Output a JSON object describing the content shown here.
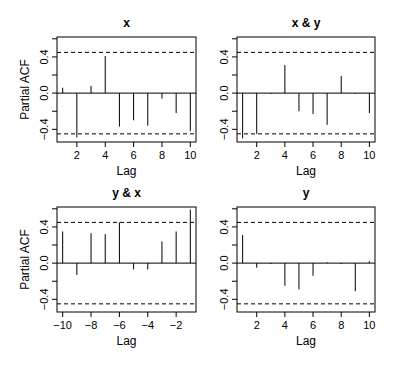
{
  "figure": {
    "layout": "2x2 grid of partial autocorrelation plots",
    "ylabel_shared": "Partial ACF"
  },
  "chart_data": [
    {
      "type": "bar",
      "subtype": "partial-acf-spikes",
      "title": "x",
      "xlabel": "Lag",
      "ylabel": "Partial ACF",
      "x": [
        1,
        2,
        3,
        4,
        5,
        6,
        7,
        8,
        9,
        10
      ],
      "values": [
        0.06,
        -0.49,
        0.08,
        0.41,
        -0.37,
        -0.3,
        -0.36,
        -0.06,
        -0.22,
        -0.42
      ],
      "xticks": [
        2,
        4,
        6,
        8,
        10
      ],
      "xtick_labels": [
        "2",
        "4",
        "6",
        "8",
        "10"
      ],
      "xlim": [
        0.6,
        10.4
      ],
      "yticks": [
        -0.4,
        -0.2,
        0.0,
        0.2,
        0.4,
        0.6
      ],
      "ytick_labels": [
        "-0.4",
        "",
        "0.0",
        "",
        "0.4",
        ""
      ],
      "ylim": [
        -0.54,
        0.62
      ],
      "confidence_bounds": [
        -0.45,
        0.45
      ],
      "grid": false,
      "show_ylabel": true
    },
    {
      "type": "bar",
      "subtype": "partial-acf-spikes",
      "title": "x & y",
      "xlabel": "Lag",
      "ylabel": "",
      "x": [
        1,
        2,
        3,
        4,
        5,
        6,
        7,
        8,
        9,
        10
      ],
      "values": [
        -0.5,
        -0.45,
        -0.01,
        0.31,
        -0.2,
        -0.23,
        -0.35,
        0.19,
        -0.01,
        -0.22
      ],
      "xticks": [
        2,
        4,
        6,
        8,
        10
      ],
      "xtick_labels": [
        "2",
        "4",
        "6",
        "8",
        "10"
      ],
      "xlim": [
        0.6,
        10.4
      ],
      "yticks": [
        -0.4,
        -0.2,
        0.0,
        0.2,
        0.4,
        0.6
      ],
      "ytick_labels": [
        "-0.4",
        "",
        "0.0",
        "",
        "0.4",
        ""
      ],
      "ylim": [
        -0.54,
        0.62
      ],
      "confidence_bounds": [
        -0.45,
        0.45
      ],
      "grid": false,
      "show_ylabel": false
    },
    {
      "type": "bar",
      "subtype": "partial-acf-spikes",
      "title": "y & x",
      "xlabel": "Lag",
      "ylabel": "Partial ACF",
      "x": [
        -10,
        -9,
        -8,
        -7,
        -6,
        -5,
        -4,
        -3,
        -2,
        -1
      ],
      "values": [
        0.35,
        -0.13,
        0.33,
        0.32,
        0.45,
        -0.07,
        -0.07,
        0.24,
        0.35,
        0.59
      ],
      "xticks": [
        -10,
        -8,
        -6,
        -4,
        -2
      ],
      "xtick_labels": [
        "−10",
        "−8",
        "−6",
        "−4",
        "−2"
      ],
      "xlim": [
        -10.4,
        -0.6
      ],
      "yticks": [
        -0.4,
        -0.2,
        0.0,
        0.2,
        0.4,
        0.6
      ],
      "ytick_labels": [
        "-0.4",
        "",
        "0.0",
        "",
        "0.4",
        ""
      ],
      "ylim": [
        -0.54,
        0.62
      ],
      "confidence_bounds": [
        -0.45,
        0.45
      ],
      "grid": false,
      "show_ylabel": true
    },
    {
      "type": "bar",
      "subtype": "partial-acf-spikes",
      "title": "y",
      "xlabel": "Lag",
      "ylabel": "",
      "x": [
        1,
        2,
        3,
        4,
        5,
        6,
        7,
        8,
        9,
        10
      ],
      "values": [
        0.31,
        -0.05,
        -0.01,
        -0.25,
        -0.29,
        -0.14,
        0.01,
        -0.01,
        -0.31,
        0.02
      ],
      "xticks": [
        2,
        4,
        6,
        8,
        10
      ],
      "xtick_labels": [
        "2",
        "4",
        "6",
        "8",
        "10"
      ],
      "xlim": [
        0.6,
        10.4
      ],
      "yticks": [
        -0.4,
        -0.2,
        0.0,
        0.2,
        0.4,
        0.6
      ],
      "ytick_labels": [
        "-0.4",
        "",
        "0.0",
        "",
        "0.4",
        ""
      ],
      "ylim": [
        -0.54,
        0.62
      ],
      "confidence_bounds": [
        -0.45,
        0.45
      ],
      "grid": false,
      "show_ylabel": false
    }
  ],
  "colors": {
    "spike": "#000000",
    "axis": "#000000",
    "bounds": "#000000",
    "background": "#ffffff"
  }
}
